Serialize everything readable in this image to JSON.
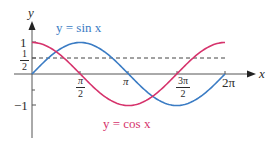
{
  "chart_data": {
    "type": "line",
    "title": "",
    "xlabel": "x",
    "ylabel": "y",
    "xlim": [
      0,
      6.2832
    ],
    "ylim": [
      -1,
      1
    ],
    "grid": false,
    "legend_position": "inline labels",
    "x_ticks": [
      "π/2",
      "π",
      "3π/2",
      "2π"
    ],
    "y_ticks": [
      "1",
      "1/2",
      "-1"
    ],
    "reference_lines": [
      {
        "type": "horizontal-dashed",
        "y": 0.5
      }
    ],
    "series": [
      {
        "name": "y = sin x",
        "function": "sin(x)",
        "color": "#3b7cc4",
        "x": [
          0,
          1.5708,
          3.1416,
          4.7124,
          6.2832
        ],
        "values": [
          0,
          1,
          0,
          -1,
          0
        ]
      },
      {
        "name": "y = cos x",
        "function": "cos(x)",
        "color": "#d6336c",
        "x": [
          0,
          1.5708,
          3.1416,
          4.7124,
          6.2832
        ],
        "values": [
          1,
          0,
          -1,
          0,
          1
        ]
      }
    ],
    "annotations": [
      "y = sin x",
      "y = cos x"
    ]
  },
  "labels": {
    "y_axis": "y",
    "x_axis": "x",
    "tick_one": "1",
    "tick_half_num": "1",
    "tick_half_den": "2",
    "tick_neg_one": "−1",
    "tick_pi_half_num": "π",
    "tick_pi_half_den": "2",
    "tick_pi": "π",
    "tick_3pi_half_num": "3π",
    "tick_3pi_half_den": "2",
    "tick_2pi": "2π",
    "sin_label": "y = sin x",
    "cos_label": "y = cos x"
  }
}
